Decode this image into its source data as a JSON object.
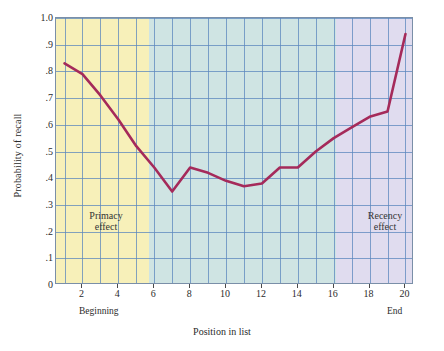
{
  "chart_data": {
    "type": "line",
    "title": "",
    "xlabel": "Position in list",
    "ylabel": "Probability of recall",
    "xlim": [
      1,
      20
    ],
    "ylim": [
      0,
      1.0
    ],
    "grid": true,
    "legend": "none",
    "x": [
      1,
      2,
      3,
      4,
      5,
      6,
      7,
      8,
      9,
      10,
      11,
      12,
      13,
      14,
      15,
      16,
      17,
      18,
      19,
      20
    ],
    "values": [
      0.83,
      0.79,
      0.71,
      0.62,
      0.52,
      0.44,
      0.35,
      0.44,
      0.42,
      0.39,
      0.37,
      0.38,
      0.44,
      0.44,
      0.5,
      0.55,
      0.59,
      0.63,
      0.65,
      0.94
    ],
    "series": [
      {
        "name": "Probability of recall",
        "color": "#a52a5a",
        "values": [
          0.83,
          0.79,
          0.71,
          0.62,
          0.52,
          0.44,
          0.35,
          0.44,
          0.42,
          0.39,
          0.37,
          0.38,
          0.44,
          0.44,
          0.5,
          0.55,
          0.59,
          0.63,
          0.65,
          0.94
        ]
      }
    ],
    "ytick_labels": [
      "1.0",
      ".9",
      ".8",
      ".7",
      ".6",
      ".5",
      ".4",
      ".3",
      ".2",
      ".1",
      "0"
    ],
    "ytick_values": [
      1.0,
      0.9,
      0.8,
      0.7,
      0.6,
      0.5,
      0.4,
      0.3,
      0.2,
      0.1,
      0
    ],
    "xtick_labels": [
      "2",
      "4",
      "6",
      "8",
      "10",
      "12",
      "14",
      "16",
      "18",
      "20"
    ],
    "xtick_values": [
      2,
      4,
      6,
      8,
      10,
      12,
      14,
      16,
      18,
      20
    ],
    "annotations": [
      {
        "name": "primacy",
        "text_line1": "Primacy",
        "text_line2": "effect",
        "x_range": [
          1,
          5
        ]
      },
      {
        "name": "recency",
        "text_line1": "Recency",
        "text_line2": "effect",
        "x_range": [
          16,
          20
        ]
      }
    ],
    "axis_endpoints": {
      "left": "Beginning",
      "right": "End"
    },
    "bands": [
      {
        "name": "primacy-band",
        "color": "#f7f0b9",
        "x_range": [
          1,
          5
        ]
      },
      {
        "name": "middle-band",
        "color": "#cfe4e3",
        "x_range": [
          5,
          16
        ]
      },
      {
        "name": "recency-band",
        "color": "#e0dcef",
        "x_range": [
          16,
          20
        ]
      }
    ],
    "colors": {
      "line": "#a52a5a",
      "grid": "#5b87bd",
      "frame": "#7a8fa8",
      "background": "#ffffff"
    }
  }
}
